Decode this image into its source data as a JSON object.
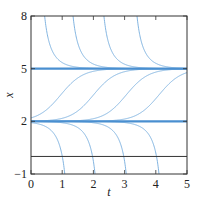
{
  "chart_data": {
    "type": "line",
    "title": "",
    "xlabel": "t",
    "ylabel": "x",
    "xlim": [
      0,
      5
    ],
    "ylim": [
      -1,
      8
    ],
    "xticks": [
      0,
      1,
      2,
      3,
      4,
      5
    ],
    "xtick_labels": [
      "0",
      "1",
      "2",
      "3",
      "4",
      "5"
    ],
    "yticks": [
      -1,
      2,
      5,
      8
    ],
    "ytick_labels": [
      "−1",
      "2",
      "5",
      "8"
    ],
    "grid": false,
    "legend": null,
    "equilibria": [
      {
        "value": 5,
        "style": "thick-blue"
      },
      {
        "value": 2,
        "style": "thick-blue"
      },
      {
        "value": 0,
        "style": "thin-black"
      }
    ],
    "model": "dx/dt = c (x - 2)(5 - x), solutions via u=(x-2)/(5-x)=s*exp(k(t-t0)), k=2.8",
    "rate_k": 2.8,
    "series": [
      {
        "name": "above-5 #1",
        "family": "top",
        "t0": 0.19,
        "enters_top_at_t": 0.44
      },
      {
        "name": "above-5 #2",
        "family": "top",
        "t0": 1.1,
        "enters_top_at_t": 1.35
      },
      {
        "name": "above-5 #3",
        "family": "top",
        "t0": 2.09,
        "enters_top_at_t": 2.34
      },
      {
        "name": "above-5 #4",
        "family": "top",
        "t0": 3.15,
        "enters_top_at_t": 3.4
      },
      {
        "name": "between-2-5 #1",
        "family": "middle",
        "t0": 0.95,
        "midpoint_x": 3.5
      },
      {
        "name": "between-2-5 #2",
        "family": "middle",
        "t0": 2.0,
        "midpoint_x": 3.5
      },
      {
        "name": "between-2-5 #3",
        "family": "middle",
        "t0": 3.05,
        "midpoint_x": 3.5
      },
      {
        "name": "between-2-5 #4",
        "family": "middle",
        "t0": 4.1,
        "midpoint_x": 3.5
      },
      {
        "name": "below-2 #1",
        "family": "bottom",
        "t0": 1.33,
        "exits_bottom_at_t": 1.08
      },
      {
        "name": "below-2 #2",
        "family": "bottom",
        "t0": 2.3,
        "exits_bottom_at_t": 2.05
      },
      {
        "name": "below-2 #3",
        "family": "bottom",
        "t0": 3.3,
        "exits_bottom_at_t": 3.05
      },
      {
        "name": "below-2 #4",
        "family": "bottom",
        "t0": 4.35,
        "exits_bottom_at_t": 4.1
      }
    ]
  },
  "colors": {
    "equilibrium": "#4a8fd0",
    "curve": "#74abdc",
    "axis": "#333333",
    "zero_line": "#333333"
  },
  "plot_box": {
    "left": 31,
    "top": 16,
    "right": 187,
    "bottom": 174
  }
}
